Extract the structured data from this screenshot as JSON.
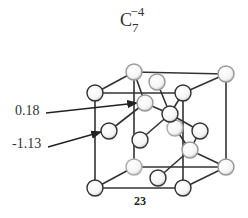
{
  "figure": {
    "title_base": "C",
    "title_subscript": "7",
    "title_superscript": "−4",
    "labels": [
      {
        "text": "0.18"
      },
      {
        "text": "-1.13"
      }
    ],
    "caption": "23"
  }
}
